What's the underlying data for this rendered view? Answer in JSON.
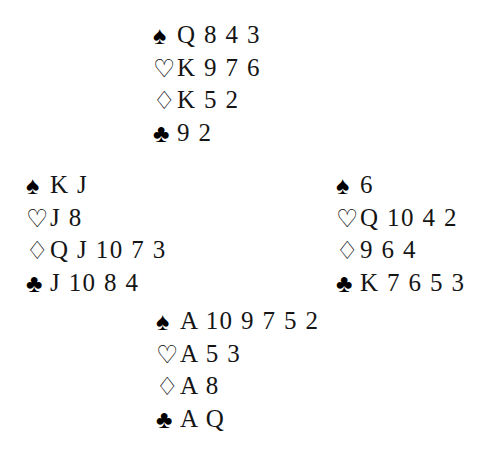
{
  "diagram": {
    "type": "bridge-deal",
    "background_color": "#ffffff",
    "text_color": "#111111",
    "suit_glyphs": {
      "spades": "♠",
      "hearts": "♡",
      "diamonds": "♢",
      "clubs": "♣"
    },
    "suit_order": [
      "spades",
      "hearts",
      "diamonds",
      "clubs"
    ],
    "hands": {
      "north": {
        "position_label": "north",
        "spades": "Q 8 4 3",
        "hearts": "K 9 7 6",
        "diamonds": "K 5 2",
        "clubs": "9 2"
      },
      "west": {
        "position_label": "west",
        "spades": "K J",
        "hearts": "J 8",
        "diamonds": "Q J 10 7 3",
        "clubs": "J 10 8 4"
      },
      "east": {
        "position_label": "east",
        "spades": "6",
        "hearts": "Q 10 4 2",
        "diamonds": "9 6 4",
        "clubs": "K 7 6 5 3"
      },
      "south": {
        "position_label": "south",
        "spades": "A 10 9 7 5 2",
        "hearts": "A 5 3",
        "diamonds": "A 8",
        "clubs": "A Q"
      }
    }
  }
}
